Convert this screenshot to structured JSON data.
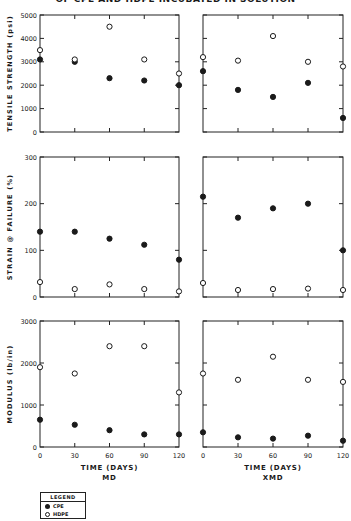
{
  "title": "OF CPE AND HDPE INCUBATED IN SOLUTION",
  "legend": {
    "title": "LEGEND",
    "items": [
      {
        "label": "CPE",
        "marker": "filled-circle"
      },
      {
        "label": "HDPE",
        "marker": "open-circle"
      }
    ]
  },
  "x_axis": {
    "label": "TIME (DAYS)",
    "ticks": [
      "0",
      "30",
      "60",
      "90",
      "120"
    ],
    "columns": [
      "MD",
      "XMD"
    ]
  },
  "chart_data": [
    {
      "type": "scatter",
      "title": "Tensile Strength - MD",
      "xlabel": "TIME (DAYS)",
      "ylabel": "TENSILE STRENGTH (psi)",
      "x": [
        0,
        30,
        60,
        90,
        120
      ],
      "ylim": [
        0,
        5000
      ],
      "yticks": [
        "0",
        "1000",
        "2000",
        "3000",
        "4000",
        "5000"
      ],
      "series": [
        {
          "name": "CPE",
          "values": [
            3100,
            3000,
            2300,
            2200,
            2000
          ]
        },
        {
          "name": "HDPE",
          "values": [
            3500,
            3100,
            4500,
            3100,
            2500
          ]
        }
      ]
    },
    {
      "type": "scatter",
      "title": "Tensile Strength - XMD",
      "xlabel": "TIME (DAYS)",
      "ylabel": "TENSILE STRENGTH (psi)",
      "x": [
        0,
        30,
        60,
        90,
        120
      ],
      "ylim": [
        0,
        5000
      ],
      "series": [
        {
          "name": "CPE",
          "values": [
            2600,
            1800,
            1500,
            2100,
            600
          ]
        },
        {
          "name": "HDPE",
          "values": [
            3200,
            3050,
            4100,
            3000,
            2800
          ]
        }
      ]
    },
    {
      "type": "scatter",
      "title": "Strain @ Failure - MD",
      "xlabel": "TIME (DAYS)",
      "ylabel": "STRAIN @ FAILURE (%)",
      "x": [
        0,
        30,
        60,
        90,
        120
      ],
      "ylim": [
        0,
        300
      ],
      "yticks": [
        "0",
        "100",
        "200",
        "300"
      ],
      "series": [
        {
          "name": "CPE",
          "values": [
            140,
            140,
            125,
            112,
            80
          ]
        },
        {
          "name": "HDPE",
          "values": [
            32,
            17,
            27,
            17,
            12
          ]
        }
      ]
    },
    {
      "type": "scatter",
      "title": "Strain @ Failure - XMD",
      "xlabel": "TIME (DAYS)",
      "ylabel": "STRAIN @ FAILURE (%)",
      "x": [
        0,
        30,
        60,
        90,
        120
      ],
      "ylim": [
        0,
        300
      ],
      "series": [
        {
          "name": "CPE",
          "values": [
            215,
            170,
            190,
            200,
            100
          ]
        },
        {
          "name": "HDPE",
          "values": [
            30,
            15,
            17,
            18,
            15
          ]
        }
      ]
    },
    {
      "type": "scatter",
      "title": "Modulus - MD",
      "xlabel": "TIME (DAYS)",
      "ylabel": "MODULUS (lb/in)",
      "x": [
        0,
        30,
        60,
        90,
        120
      ],
      "ylim": [
        0,
        3000
      ],
      "yticks": [
        "0",
        "1000",
        "2000",
        "3000"
      ],
      "series": [
        {
          "name": "CPE",
          "values": [
            650,
            530,
            400,
            300,
            300
          ]
        },
        {
          "name": "HDPE",
          "values": [
            1900,
            1750,
            2400,
            2400,
            1300
          ]
        }
      ]
    },
    {
      "type": "scatter",
      "title": "Modulus - XMD",
      "xlabel": "TIME (DAYS)",
      "ylabel": "MODULUS (lb/in)",
      "x": [
        0,
        30,
        60,
        90,
        120
      ],
      "ylim": [
        0,
        3000
      ],
      "series": [
        {
          "name": "CPE",
          "values": [
            350,
            230,
            200,
            270,
            150
          ]
        },
        {
          "name": "HDPE",
          "values": [
            1750,
            1600,
            2150,
            1600,
            1550
          ]
        }
      ]
    }
  ]
}
